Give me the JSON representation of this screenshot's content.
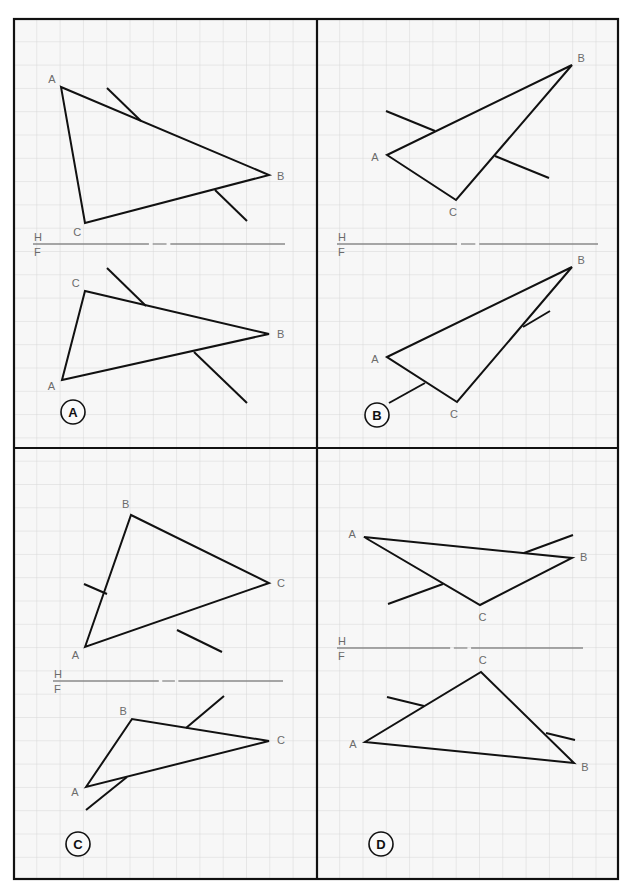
{
  "figure": {
    "folding_line": {
      "upper": "H",
      "lower": "F"
    },
    "colors": {
      "grid": "#d9d9d9",
      "frame": "#111111",
      "edges": "#111111",
      "labels": "#6b6b6b",
      "paper": "#f7f7f7",
      "fold_line": "#8a8a8a"
    },
    "footer_caption_visible": "(cut-off text at bottom edge, illegible)"
  },
  "panels": [
    {
      "id": "A",
      "badge": "A",
      "top_view": {
        "vertices": {
          "A": [
            61,
            87
          ],
          "B": [
            269,
            175
          ],
          "C": [
            85,
            223
          ]
        },
        "labels": {
          "A": "A",
          "B": "B",
          "C": "C"
        },
        "lines": [
          [
            [
              107,
              88
            ],
            [
              141,
              121
            ]
          ],
          [
            [
              215,
              190
            ],
            [
              247,
              221
            ]
          ]
        ]
      },
      "fold_y": 244,
      "front_view": {
        "vertices": {
          "A": [
            62,
            380
          ],
          "B": [
            269,
            334
          ],
          "C": [
            85,
            291
          ]
        },
        "labels": {
          "A": "A",
          "B": "B",
          "C": "C"
        },
        "lines": [
          [
            [
              107,
              268
            ],
            [
              146,
              306
            ]
          ],
          [
            [
              194,
              352
            ],
            [
              247,
              403
            ]
          ]
        ]
      }
    },
    {
      "id": "B",
      "badge": "B",
      "top_view": {
        "vertices": {
          "A": [
            387,
            155
          ],
          "B": [
            572,
            65
          ],
          "C": [
            456,
            200
          ]
        },
        "labels": {
          "A": "A",
          "B": "B",
          "C": "C"
        },
        "lines": [
          [
            [
              386,
              111
            ],
            [
              435,
              131
            ]
          ],
          [
            [
              495,
              156
            ],
            [
              549,
              178
            ]
          ]
        ]
      },
      "fold_y": 244,
      "front_view": {
        "vertices": {
          "A": [
            387,
            357
          ],
          "B": [
            572,
            267
          ],
          "C": [
            457,
            402
          ]
        },
        "labels": {
          "A": "A",
          "B": "B",
          "C": "C"
        },
        "lines": [
          [
            [
              523,
              327
            ],
            [
              550,
              311
            ]
          ],
          [
            [
              389,
              403
            ],
            [
              425,
              383
            ]
          ]
        ]
      }
    },
    {
      "id": "C",
      "badge": "C",
      "top_view": {
        "vertices": {
          "A": [
            85,
            647
          ],
          "B": [
            131,
            515
          ],
          "C": [
            269,
            583
          ]
        },
        "labels": {
          "A": "A",
          "B": "B",
          "C": "C"
        },
        "lines": [
          [
            [
              84,
              584
            ],
            [
              107,
              594
            ]
          ],
          [
            [
              177,
              630
            ],
            [
              222,
              652
            ]
          ]
        ]
      },
      "fold_y": 681,
      "front_view": {
        "vertices": {
          "A": [
            86,
            787
          ],
          "B": [
            132,
            719
          ],
          "C": [
            269,
            741
          ]
        },
        "labels": {
          "A": "A",
          "B": "B",
          "C": "C"
        },
        "lines": [
          [
            [
              186,
              728
            ],
            [
              224,
              696
            ]
          ],
          [
            [
              86,
              810
            ],
            [
              127,
              777
            ]
          ]
        ]
      }
    },
    {
      "id": "D",
      "badge": "D",
      "top_view": {
        "vertices": {
          "A": [
            364,
            537
          ],
          "B": [
            572,
            558
          ],
          "C": [
            480,
            605
          ]
        },
        "labels": {
          "A": "A",
          "B": "B",
          "C": "C"
        },
        "lines": [
          [
            [
              524,
              553
            ],
            [
              573,
              535
            ]
          ],
          [
            [
              388,
              604
            ],
            [
              443,
              584
            ]
          ]
        ]
      },
      "fold_y": 648,
      "front_view": {
        "vertices": {
          "A": [
            365,
            742
          ],
          "B": [
            574,
            763
          ],
          "C": [
            481,
            672
          ]
        },
        "labels": {
          "A": "A",
          "B": "B",
          "C": "C"
        },
        "lines": [
          [
            [
              387,
              697
            ],
            [
              424,
              706
            ]
          ],
          [
            [
              546,
              733
            ],
            [
              575,
              740
            ]
          ]
        ]
      }
    }
  ]
}
